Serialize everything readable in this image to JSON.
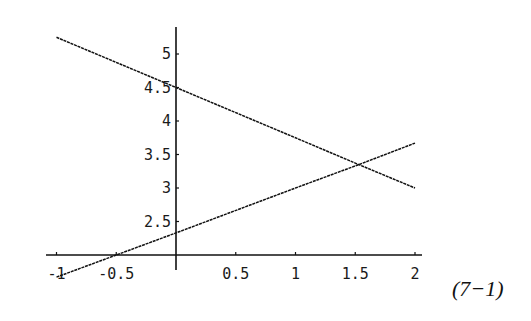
{
  "chart_data": {
    "type": "line",
    "title": "",
    "xlabel": "",
    "ylabel": "",
    "xlim": [
      -1,
      2
    ],
    "ylim": [
      2,
      5.3
    ],
    "axes_origin": {
      "x": 0,
      "y": 2
    },
    "grid": false,
    "legend": null,
    "x_ticks": [
      -1,
      -0.5,
      0.5,
      1,
      1.5,
      2
    ],
    "x_tick_labels": [
      "-1",
      "-0.5",
      "0.5",
      "1",
      "1.5",
      "2"
    ],
    "y_ticks": [
      2.5,
      3,
      3.5,
      4,
      4.5,
      5
    ],
    "y_tick_labels": [
      "2.5",
      "3",
      "3.5",
      "4",
      "4.5",
      "5"
    ],
    "series": [
      {
        "name": "line-decreasing",
        "x": [
          -1,
          0,
          1,
          1.53,
          2
        ],
        "y": [
          5.25,
          4.5,
          3.75,
          3.35,
          3.0
        ],
        "color": "#111111"
      },
      {
        "name": "line-increasing",
        "x": [
          -1,
          -0.5,
          0,
          1,
          1.53,
          2
        ],
        "y": [
          1.67,
          2.0,
          2.33,
          3.0,
          3.35,
          3.67
        ],
        "color": "#111111"
      }
    ],
    "annotations": [
      {
        "text": "(7−1)",
        "position": "right of plot, below x-axis"
      }
    ]
  },
  "equation_label": "(7−1)"
}
